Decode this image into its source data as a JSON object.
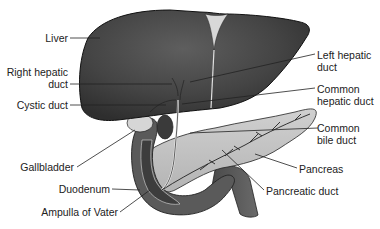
{
  "diagram": {
    "type": "anatomical-illustration",
    "labels_left": {
      "liver": "Liver",
      "right_hepatic_duct_1": "Right hepatic",
      "right_hepatic_duct_2": "duct",
      "cystic_duct": "Cystic duct",
      "gallbladder": "Gallbladder",
      "duodenum": "Duodenum",
      "ampulla": "Ampulla of Vater"
    },
    "labels_right": {
      "left_hepatic_duct_1": "Left hepatic",
      "left_hepatic_duct_2": "duct",
      "common_hepatic_duct_1": "Common",
      "common_hepatic_duct_2": "hepatic duct",
      "common_bile_duct_1": "Common",
      "common_bile_duct_2": "bile duct",
      "pancreas": "Pancreas",
      "pancreatic_duct": "Pancreatic duct"
    },
    "colors": {
      "liver": "#3e3e3e",
      "liver_highlight": "#5a5a5a",
      "pancreas": "#c4c4c4",
      "gallbladder": "#d8d8d8",
      "duodenum": "#5c5c5c",
      "duct": "#e8e8e8",
      "leader_line": "#222222",
      "text": "#222222"
    }
  }
}
